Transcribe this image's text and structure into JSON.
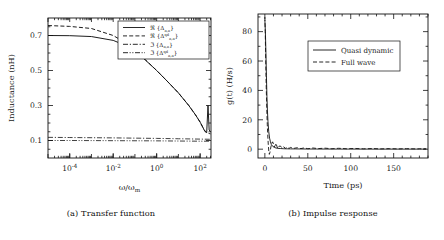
{
  "figure": {
    "panels": [
      {
        "id": "transfer-function",
        "caption": "(a) Transfer function",
        "chart_index": 0
      },
      {
        "id": "impulse-response",
        "caption": "(b) Impulse response",
        "chart_index": 1
      }
    ]
  },
  "chart_data": [
    {
      "type": "line",
      "title": "",
      "xlabel": "ω/ω",
      "xlabel_sub": "m",
      "ylabel": "Inductance (nH)",
      "xscale": "log",
      "yscale": "linear",
      "xlim": [
        1e-05,
        316.0
      ],
      "ylim": [
        0.0,
        0.8
      ],
      "xticks": [
        0.0001,
        0.01,
        1,
        100
      ],
      "xticklabels": [
        "10−4",
        "10−2",
        "10⁰",
        "10²"
      ],
      "xtick_exponents": [
        "-4",
        "-2",
        "0",
        "2"
      ],
      "yticks": [
        0.1,
        0.3,
        0.5,
        0.7
      ],
      "yticklabels": [
        "0.1",
        "0.3",
        "0.5",
        "0.7"
      ],
      "grid": false,
      "legend_position": "upper right",
      "series": [
        {
          "name": "ℜ {Δ}",
          "label_parts": {
            "op": "ℜ",
            "sym": "Δ",
            "sub": "n,n",
            "sup": ""
          },
          "style": "solid",
          "color": "#111111",
          "x": [
            1e-05,
            0.0001,
            0.001,
            0.01,
            0.03,
            0.1,
            0.3,
            1,
            3,
            10,
            30,
            60,
            100,
            130,
            150,
            170,
            200,
            230,
            260,
            300
          ],
          "y": [
            0.7,
            0.699,
            0.694,
            0.672,
            0.648,
            0.612,
            0.56,
            0.5,
            0.44,
            0.372,
            0.3,
            0.248,
            0.205,
            0.178,
            0.162,
            0.15,
            0.145,
            0.3,
            0.16,
            0.15
          ]
        },
        {
          "name": "ℜ {Δ qd}",
          "label_parts": {
            "op": "ℜ",
            "sym": "Δ",
            "sub": "n,n",
            "sup": "qd"
          },
          "style": "dashed",
          "color": "#111111",
          "x": [
            1e-05,
            0.0001,
            0.001,
            0.01,
            0.03,
            0.1,
            0.3,
            1,
            3,
            10,
            30,
            60,
            100,
            150,
            200,
            260,
            300
          ],
          "y": [
            0.757,
            0.752,
            0.74,
            0.7,
            0.665,
            0.618,
            0.562,
            0.5,
            0.44,
            0.372,
            0.3,
            0.248,
            0.205,
            0.162,
            0.145,
            0.14,
            0.138
          ]
        },
        {
          "name": "ℑ {Δ}",
          "label_parts": {
            "op": "ℑ",
            "sym": "Δ",
            "sub": "n,n",
            "sup": ""
          },
          "style": "dashdot",
          "color": "#111111",
          "x": [
            1e-05,
            0.0001,
            0.01,
            1,
            10,
            100,
            300
          ],
          "y": [
            0.118,
            0.117,
            0.115,
            0.112,
            0.11,
            0.108,
            0.107
          ]
        },
        {
          "name": "ℑ {Δ qd}",
          "label_parts": {
            "op": "ℑ",
            "sym": "Δ",
            "sub": "n,n",
            "sup": "qd"
          },
          "style": "dashdotdot",
          "color": "#111111",
          "x": [
            1e-05,
            0.0001,
            0.01,
            1,
            10,
            100,
            300
          ],
          "y": [
            0.1,
            0.1,
            0.099,
            0.098,
            0.097,
            0.096,
            0.096
          ]
        }
      ]
    },
    {
      "type": "line",
      "title": "",
      "xlabel": "Time (ps)",
      "ylabel": "g(t) (H/s)",
      "xscale": "linear",
      "yscale": "linear",
      "xlim": [
        -8,
        190
      ],
      "ylim": [
        -6,
        92
      ],
      "xticks": [
        0,
        50,
        100,
        150
      ],
      "xticklabels": [
        "0",
        "50",
        "100",
        "150"
      ],
      "yticks": [
        0,
        20,
        40,
        60,
        80
      ],
      "yticklabels": [
        "0",
        "20",
        "40",
        "60",
        "80"
      ],
      "grid": false,
      "legend_position": "upper center",
      "series": [
        {
          "name": "Quasi dynamic",
          "label": "Quasi dynamic",
          "style": "solid",
          "color": "#111111",
          "x": [
            0,
            0.6,
            1.2,
            1.8,
            2.4,
            3.0,
            3.6,
            4.5,
            5.5,
            6.5,
            7.5,
            9,
            11,
            13,
            15,
            18,
            22,
            26,
            30,
            36,
            42,
            50,
            60,
            70,
            85,
            100,
            120,
            140,
            160,
            180,
            188
          ],
          "y": [
            88,
            80,
            66,
            50,
            36,
            26,
            19,
            12,
            7.5,
            5,
            3.2,
            2.0,
            1.2,
            0.8,
            0.6,
            0.45,
            0.3,
            0.25,
            0.2,
            0.18,
            0.15,
            0.12,
            0.1,
            0.1,
            0.08,
            0.08,
            0.06,
            0.05,
            0.05,
            0.05,
            0.05
          ]
        },
        {
          "name": "Full wave",
          "label": "Full wave",
          "style": "dashed",
          "color": "#111111",
          "x": [
            0,
            0.5,
            1.0,
            1.6,
            2.2,
            2.8,
            3.4,
            4.0,
            4.6,
            5.2,
            6.0,
            7.0,
            8.0,
            9.0,
            10,
            11,
            12,
            13,
            14,
            15,
            16,
            18,
            20,
            22,
            24,
            26,
            28,
            30,
            34,
            38,
            42,
            46,
            50,
            56,
            62,
            70,
            78,
            86,
            95,
            105,
            115,
            125,
            135,
            145,
            155,
            165,
            175,
            185,
            188
          ],
          "y": [
            90,
            78,
            60,
            42,
            28,
            17,
            9,
            3,
            -1.5,
            -3.5,
            -2.0,
            1.5,
            4.0,
            5.0,
            3.5,
            1.5,
            2.5,
            4.0,
            2.0,
            0.5,
            1.8,
            2.2,
            0.8,
            1.6,
            0.6,
            1.4,
            0.5,
            1.2,
            0.6,
            1.0,
            0.4,
            0.9,
            0.3,
            0.8,
            0.4,
            0.7,
            0.3,
            0.6,
            0.3,
            0.5,
            0.25,
            0.45,
            0.2,
            0.4,
            0.2,
            0.35,
            0.2,
            0.3,
            0.25
          ]
        }
      ]
    }
  ]
}
